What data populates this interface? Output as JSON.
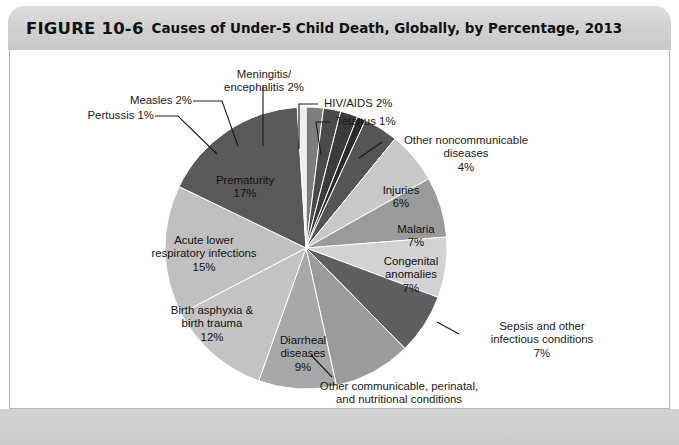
{
  "header": {
    "figure_number": "FIGURE 10-6",
    "title": "Causes of Under-5 Child Death, Globally, by Percentage, 2013"
  },
  "chart_data": {
    "type": "pie",
    "title": "Causes of Under-5 Child Death, Globally, by Percentage, 2013",
    "xlabel": "",
    "ylabel": "",
    "legend_position": "none",
    "grid": false,
    "units": "percent",
    "start_angle_deg": 0,
    "direction": "clockwise",
    "categories": [
      "Measles",
      "Meningitis/encephalitis",
      "HIV/AIDS",
      "Tetanus",
      "Other noncommunicable diseases",
      "Injuries",
      "Malaria",
      "Congenital anomalies",
      "Sepsis and other infectious conditions",
      "Other communicable, perinatal, and nutritional conditions",
      "Diarrheal diseases",
      "Birth asphyxia & birth trauma",
      "Acute lower respiratory infections",
      "Prematurity",
      "Pertussis"
    ],
    "values": [
      2,
      2,
      2,
      1,
      4,
      6,
      7,
      7,
      7,
      9,
      9,
      12,
      15,
      17,
      1
    ],
    "colors": [
      "#7d7d7d",
      "#4a4a4a",
      "#3b3b3b",
      "#2b2b2b",
      "#555555",
      "#c8c8c8",
      "#9a9a9a",
      "#d2d2d2",
      "#5f5f5f",
      "#9b9b9b",
      "#a8a8a8",
      "#c3c3c3",
      "#c0c0c0",
      "#595959",
      "#efefef"
    ],
    "slices": [
      {
        "label": "Measles",
        "value": 2,
        "value_text": "Measles 2%",
        "color": "#7d7d7d"
      },
      {
        "label": "Meningitis/encephalitis",
        "value": 2,
        "value_text": "Meningitis/encephalitis 2%",
        "color": "#4a4a4a"
      },
      {
        "label": "HIV/AIDS",
        "value": 2,
        "value_text": "HIV/AIDS 2%",
        "color": "#3b3b3b"
      },
      {
        "label": "Tetanus",
        "value": 1,
        "value_text": "Tetanus 1%",
        "color": "#2b2b2b"
      },
      {
        "label": "Other noncommunicable diseases",
        "value": 4,
        "value_text": "Other noncommunicable diseases 4%",
        "color": "#555555"
      },
      {
        "label": "Injuries",
        "value": 6,
        "value_text": "Injuries 6%",
        "color": "#c8c8c8"
      },
      {
        "label": "Malaria",
        "value": 7,
        "value_text": "Malaria 7%",
        "color": "#9a9a9a"
      },
      {
        "label": "Congenital anomalies",
        "value": 7,
        "value_text": "Congenital anomalies 7%",
        "color": "#d2d2d2"
      },
      {
        "label": "Sepsis and other infectious conditions",
        "value": 7,
        "value_text": "Sepsis and other infectious conditions 7%",
        "color": "#5f5f5f"
      },
      {
        "label": "Other communicable, perinatal, and nutritional conditions",
        "value": 9,
        "value_text": "Other communicable, perinatal, and nutritional conditions 9%",
        "color": "#9b9b9b"
      },
      {
        "label": "Diarrheal diseases",
        "value": 9,
        "value_text": "Diarrheal diseases 9%",
        "color": "#a8a8a8"
      },
      {
        "label": "Birth asphyxia & birth trauma",
        "value": 12,
        "value_text": "Birth asphyxia & birth trauma 12%",
        "color": "#c3c3c3"
      },
      {
        "label": "Acute lower respiratory infections",
        "value": 15,
        "value_text": "Acute lower respiratory infections 15%",
        "color": "#c0c0c0"
      },
      {
        "label": "Prematurity",
        "value": 17,
        "value_text": "Prematurity 17%",
        "color": "#595959"
      },
      {
        "label": "Pertussis",
        "value": 1,
        "value_text": "Pertussis 1%",
        "color": "#efefef"
      }
    ]
  },
  "labels": {
    "meningitis_l1": "Meningitis/",
    "meningitis_l2": "encephalitis 2%",
    "measles": "Measles 2%",
    "pertussis": "Pertussis 1%",
    "hivaids": "HIV/AIDS 2%",
    "tetanus": "Tetanus 1%",
    "other_ncd_l1": "Other noncommunicable",
    "other_ncd_l2": "diseases",
    "other_ncd_l3": "4%",
    "injuries_l1": "Injuries",
    "injuries_l2": "6%",
    "malaria_l1": "Malaria",
    "malaria_l2": "7%",
    "congenital_l1": "Congenital",
    "congenital_l2": "anomalies",
    "congenital_l3": "7%",
    "sepsis_l1": "Sepsis and other",
    "sepsis_l2": "infectious conditions",
    "sepsis_l3": "7%",
    "othercomm_l1": "Other communicable, perinatal,",
    "othercomm_l2": "and nutritional conditions",
    "othercomm_l3": "9%",
    "diarrheal_l1": "Diarrheal",
    "diarrheal_l2": "diseases",
    "diarrheal_l3": "9%",
    "asphyxia_l1": "Birth asphyxia &",
    "asphyxia_l2": "birth trauma",
    "asphyxia_l3": "12%",
    "alri_l1": "Acute lower",
    "alri_l2": "respiratory infections",
    "alri_l3": "15%",
    "prematurity_l1": "Prematurity",
    "prematurity_l2": "17%"
  }
}
